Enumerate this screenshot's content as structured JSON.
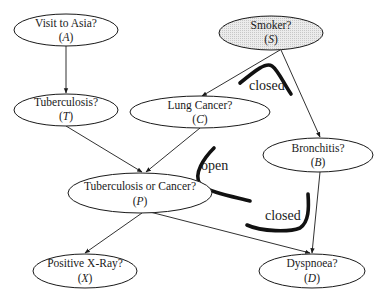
{
  "diagram": {
    "nodes": [
      {
        "id": "A",
        "label": "Visit to Asia?",
        "var": "A",
        "cx": 66,
        "cy": 30,
        "rx": 52,
        "ry": 16,
        "shaded": false
      },
      {
        "id": "S",
        "label": "Smoker?",
        "var": "S",
        "cx": 271,
        "cy": 33,
        "rx": 52,
        "ry": 17,
        "shaded": true
      },
      {
        "id": "T",
        "label": "Tuberculosis?",
        "var": "T",
        "cx": 66,
        "cy": 110,
        "rx": 52,
        "ry": 16,
        "shaded": false
      },
      {
        "id": "C",
        "label": "Lung Cancer?",
        "var": "C",
        "cx": 200,
        "cy": 112,
        "rx": 70,
        "ry": 16,
        "shaded": false
      },
      {
        "id": "B",
        "label": "Bronchitis?",
        "var": "B",
        "cx": 318,
        "cy": 155,
        "rx": 55,
        "ry": 17,
        "shaded": false
      },
      {
        "id": "P",
        "label": "Tuberculosis or Cancer?",
        "var": "P",
        "cx": 140,
        "cy": 193,
        "rx": 72,
        "ry": 20,
        "shaded": false
      },
      {
        "id": "X",
        "label": "Positive X-Ray?",
        "var": "X",
        "cx": 85,
        "cy": 271,
        "rx": 52,
        "ry": 17,
        "shaded": false
      },
      {
        "id": "D",
        "label": "Dyspnoea?",
        "var": "D",
        "cx": 312,
        "cy": 271,
        "rx": 53,
        "ry": 17,
        "shaded": false
      }
    ],
    "edges": [
      {
        "from": "A",
        "to": "T"
      },
      {
        "from": "S",
        "to": "C"
      },
      {
        "from": "S",
        "to": "B"
      },
      {
        "from": "T",
        "to": "P"
      },
      {
        "from": "C",
        "to": "P"
      },
      {
        "from": "P",
        "to": "X"
      },
      {
        "from": "P",
        "to": "D"
      },
      {
        "from": "B",
        "to": "D"
      }
    ],
    "path_annotations": [
      {
        "label": "closed",
        "position": "near Smoker between C and B"
      },
      {
        "label": "open",
        "position": "between C and P"
      },
      {
        "label": "closed",
        "position": "near Dyspnoea between P and B"
      }
    ]
  }
}
